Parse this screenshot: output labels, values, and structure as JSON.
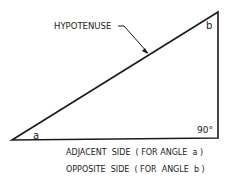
{
  "diagram": {
    "type": "right-triangle",
    "labels": {
      "hypotenuse": "HYPOTENUSE",
      "angle_a": "a",
      "angle_b": "b",
      "right_angle": "90°",
      "adjacent": "ADJACENT  SIDE  ( FOR ANGLE  a )",
      "opposite": "OPPOSITE  SIDE  ( FOR  ANGLE  b )"
    },
    "colors": {
      "stroke": "#1a1a1a",
      "background": "#ffffff"
    }
  }
}
